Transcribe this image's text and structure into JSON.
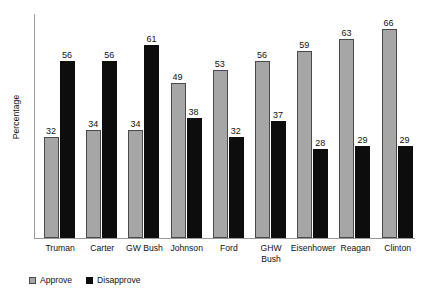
{
  "chart_data": {
    "type": "bar",
    "title": "",
    "xlabel": "",
    "ylabel": "Percentage",
    "ylim": [
      0,
      70
    ],
    "grid": false,
    "legend_position": "bottom-left",
    "categories": [
      "Truman",
      "Carter",
      "GW Bush",
      "Johnson",
      "Ford",
      "GHW\nBush",
      "Eisenhower",
      "Reagan",
      "Clinton"
    ],
    "series": [
      {
        "name": "Approve",
        "color": "#a6a6a6",
        "values": [
          32,
          34,
          34,
          49,
          53,
          56,
          59,
          63,
          66
        ]
      },
      {
        "name": "Disapprove",
        "color": "#0d0d0d",
        "values": [
          56,
          56,
          61,
          38,
          32,
          37,
          28,
          29,
          29
        ]
      }
    ]
  },
  "legend": {
    "items": [
      {
        "label": "Approve",
        "swatch": "approve"
      },
      {
        "label": "Disapprove",
        "swatch": "disapprove"
      }
    ]
  }
}
